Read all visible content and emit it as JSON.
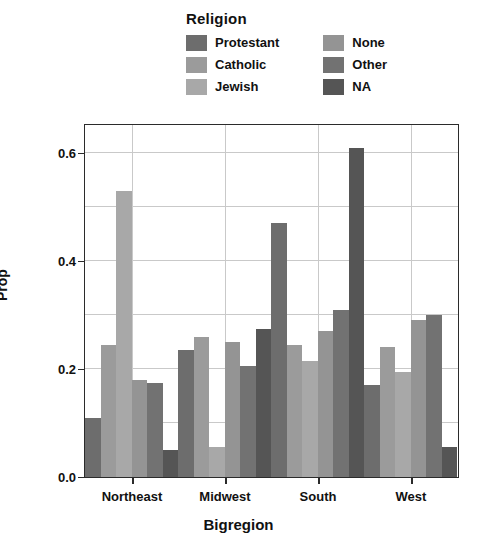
{
  "legend": {
    "title": "Religion",
    "columns": [
      [
        {
          "label": "Protestant",
          "color": "#6d6d6d"
        },
        {
          "label": "Catholic",
          "color": "#9b9b9b"
        },
        {
          "label": "Jewish",
          "color": "#a8a8a8"
        }
      ],
      [
        {
          "label": "None",
          "color": "#949494"
        },
        {
          "label": "Other",
          "color": "#727272"
        },
        {
          "label": "NA",
          "color": "#555555"
        }
      ]
    ]
  },
  "chart_data": {
    "type": "bar",
    "title": "",
    "xlabel": "Bigregion",
    "ylabel": "Prop",
    "categories": [
      "Northeast",
      "Midwest",
      "South",
      "West"
    ],
    "series": [
      {
        "name": "Protestant",
        "color": "#6d6d6d",
        "values": [
          0.11,
          0.235,
          0.47,
          0.17
        ]
      },
      {
        "name": "Catholic",
        "color": "#9b9b9b",
        "values": [
          0.245,
          0.26,
          0.245,
          0.24
        ]
      },
      {
        "name": "Jewish",
        "color": "#a8a8a8",
        "values": [
          0.53,
          0.055,
          0.215,
          0.195
        ]
      },
      {
        "name": "None",
        "color": "#949494",
        "values": [
          0.18,
          0.25,
          0.27,
          0.29
        ]
      },
      {
        "name": "Other",
        "color": "#727272",
        "values": [
          0.175,
          0.205,
          0.31,
          0.3
        ]
      },
      {
        "name": "NA",
        "color": "#555555",
        "values": [
          0.05,
          0.275,
          0.61,
          0.055
        ]
      }
    ],
    "ylim": [
      0.0,
      0.65
    ],
    "yticks": [
      0.0,
      0.2,
      0.4,
      0.6
    ],
    "ytick_labels": [
      "0.0",
      "0.2",
      "0.4",
      "0.6"
    ],
    "minor_gridlines": [
      0.1,
      0.3,
      0.5
    ],
    "grid": true,
    "legend_position": "top"
  }
}
